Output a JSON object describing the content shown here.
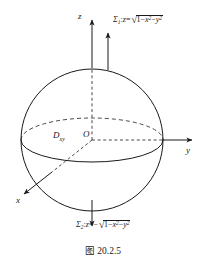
{
  "figure": {
    "caption": "图 20.2.5",
    "background_color": "#ffffff",
    "stroke_color": "#1a1a1a",
    "axes": [
      {
        "id": "z",
        "label": "z",
        "direction": "up"
      },
      {
        "id": "y",
        "label": "y",
        "direction": "right"
      },
      {
        "id": "x",
        "label": "x",
        "direction": "down-left"
      }
    ],
    "origin": {
      "label": "O"
    },
    "region": {
      "symbol": "D",
      "subscript": "xy"
    },
    "surfaces": [
      {
        "id": "sigma-1",
        "name": "upper-hemisphere",
        "sigma": "Σ",
        "sigma_subscript": "1",
        "separator": ":",
        "variable": "z",
        "equals": "=",
        "sign": "",
        "radicand": "1−x²−y²",
        "full_text": "Σ₁:z=√(1−x²−y²)",
        "normal_arrow": "up"
      },
      {
        "id": "sigma-2",
        "name": "lower-hemisphere",
        "sigma": "Σ",
        "sigma_subscript": "2",
        "separator": ":",
        "variable": "z",
        "equals": "=",
        "sign": "−",
        "radicand": "1−x²−y²",
        "full_text": "Σ₂:z=−√(1−x²−y²)",
        "normal_arrow": "down"
      }
    ],
    "sphere": {
      "description": "unit sphere x²+y²+z²=1",
      "equator_label": "equator ellipse"
    }
  }
}
